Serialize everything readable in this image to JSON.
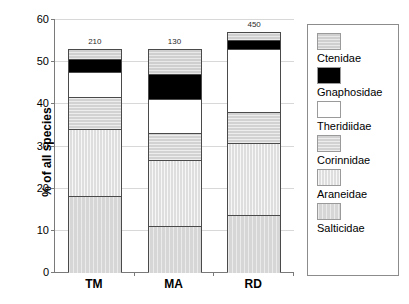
{
  "chart_data": {
    "type": "bar",
    "title": "",
    "subtitle": "",
    "xlabel": "",
    "ylabel": "% of all species",
    "ylim": [
      0,
      60
    ],
    "ytick_labels": [
      "60",
      "50",
      "40",
      "30",
      "20",
      "10",
      "0"
    ],
    "ytick_values": [
      60,
      50,
      40,
      30,
      20,
      10,
      0
    ],
    "grid": true,
    "stacked": true,
    "legend_position": "right",
    "categories": [
      "TM",
      "MA",
      "RD"
    ],
    "bar_labels": [
      "210",
      "130",
      "450"
    ],
    "series": [
      {
        "name": "Salticidae",
        "values": [
          18.0,
          11.0,
          13.5
        ]
      },
      {
        "name": "Araneidae",
        "values": [
          16.0,
          15.5,
          17.0
        ]
      },
      {
        "name": "Corinnidae",
        "values": [
          7.5,
          6.5,
          7.5
        ]
      },
      {
        "name": "Theridiidae",
        "values": [
          6.0,
          8.0,
          15.0
        ]
      },
      {
        "name": "Gnaphosidae",
        "values": [
          3.0,
          6.0,
          2.0
        ]
      },
      {
        "name": "Ctenidae",
        "values": [
          2.5,
          6.0,
          2.0
        ]
      }
    ],
    "totals": [
      53.0,
      53.0,
      57.0
    ]
  },
  "legend": {
    "items": [
      {
        "label": "Ctenidae",
        "swatch": "hatched-light-gray"
      },
      {
        "label": "Gnaphosidae",
        "swatch": "solid-black"
      },
      {
        "label": "Theridiidae",
        "swatch": "solid-white"
      },
      {
        "label": "Corinnidae",
        "swatch": "hatched-gray"
      },
      {
        "label": "Araneidae",
        "swatch": "vertical-hatch-light"
      },
      {
        "label": "Salticidae",
        "swatch": "vertical-hatch-gray"
      }
    ]
  },
  "colors": {
    "ctenidae": "#cfcfcf",
    "gnaphosidae": "#000000",
    "theridiidae": "#ffffff",
    "corinnidae": "#d2d2d2",
    "araneidae": "#dedede",
    "salticidae": "#d6d6d6",
    "axis": "#7a7a7a",
    "gridline": "#d8d8d8",
    "outline": "#4a4a4a"
  }
}
